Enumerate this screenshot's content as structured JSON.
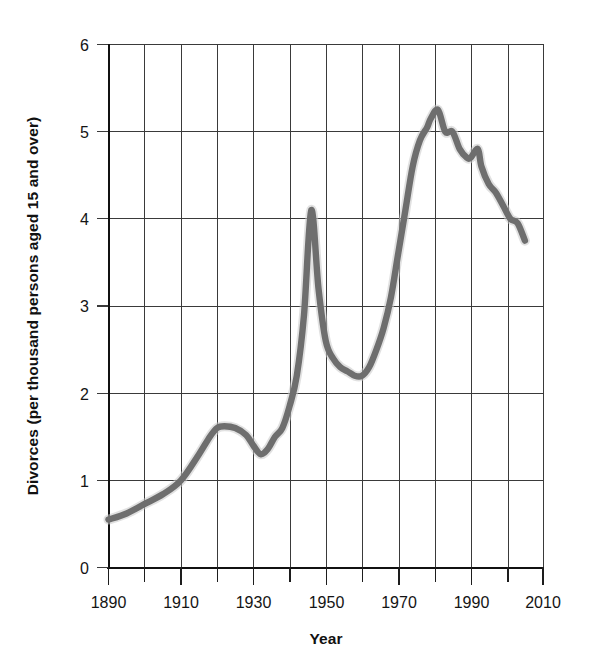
{
  "figure": {
    "background_color": "#ffffff",
    "width": 590,
    "height": 664
  },
  "chart_data": {
    "type": "line",
    "title": "",
    "subtitle": "",
    "xlabel": "Year",
    "ylabel": "Divorces (per thousand persons aged 15 and over)",
    "xlim": [
      1890,
      2010
    ],
    "ylim": [
      0,
      6
    ],
    "grid": true,
    "legend": "none",
    "x_major_tick_labels": [
      "1890",
      "1910",
      "1930",
      "1950",
      "1970",
      "1990",
      "2010"
    ],
    "x_major_tick_values": [
      1890,
      1910,
      1930,
      1950,
      1970,
      1990,
      2010
    ],
    "x_minor_tick_values": [
      1900,
      1920,
      1940,
      1960,
      1980,
      2000
    ],
    "x_tick_interval": 10,
    "y_tick_labels": [
      "0",
      "1",
      "2",
      "3",
      "4",
      "5",
      "6"
    ],
    "y_tick_values": [
      0,
      1,
      2,
      3,
      4,
      5,
      6
    ],
    "series": [
      {
        "name": "Divorces per thousand persons aged 15 and over",
        "color": "#6e6e6e",
        "x": [
          1890,
          1895,
          1900,
          1905,
          1910,
          1915,
          1918,
          1920,
          1922,
          1925,
          1928,
          1930,
          1932,
          1934,
          1936,
          1938,
          1940,
          1942,
          1944,
          1946,
          1948,
          1950,
          1952,
          1954,
          1956,
          1958,
          1960,
          1962,
          1964,
          1966,
          1968,
          1970,
          1972,
          1974,
          1976,
          1978,
          1979,
          1981,
          1983,
          1985,
          1987,
          1989,
          1990,
          1992,
          1993,
          1995,
          1997,
          1999,
          2001,
          2003,
          2005
        ],
        "y": [
          0.55,
          0.62,
          0.73,
          0.84,
          1.0,
          1.3,
          1.5,
          1.6,
          1.62,
          1.6,
          1.52,
          1.4,
          1.3,
          1.36,
          1.5,
          1.6,
          1.85,
          2.2,
          2.9,
          4.1,
          3.2,
          2.6,
          2.4,
          2.3,
          2.25,
          2.2,
          2.2,
          2.3,
          2.5,
          2.75,
          3.1,
          3.6,
          4.1,
          4.6,
          4.9,
          5.05,
          5.15,
          5.25,
          5.0,
          5.0,
          4.8,
          4.7,
          4.7,
          4.8,
          4.6,
          4.4,
          4.3,
          4.15,
          4.0,
          3.95,
          3.75
        ]
      }
    ],
    "annotations": []
  },
  "axes": {
    "y_axis_title": "Divorces (per thousand persons aged 15 and over)",
    "x_axis_title": "Year"
  }
}
